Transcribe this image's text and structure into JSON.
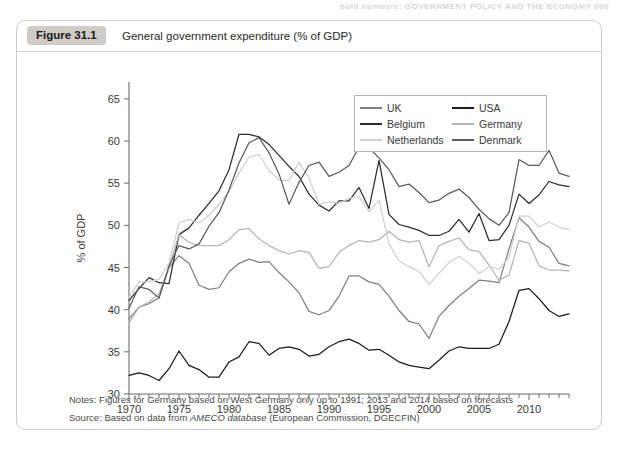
{
  "page": {
    "header_bleed": "bold numbers: GOVERNMENT POLICY AND THE ECONOMY  000"
  },
  "figure": {
    "badge": "Figure 31.1",
    "title": "General government expenditure (% of GDP)",
    "notes_label": "Notes:",
    "notes": "Notes: Figures for Germany based on West Germany only up to 1991; 2013 and 2014 based on forecasts",
    "source_prefix": "Source: Based on data from ",
    "source_em": "AMECO database",
    "source_suffix": " (European Commission, DGECFIN)",
    "source": "Source: Based on data from AMECO database (European Commission, DGECFIN)"
  },
  "legend": {
    "position": "inside-top-right",
    "entries": [
      {
        "label": "UK",
        "color": "#808080"
      },
      {
        "label": "USA",
        "color": "#1c1c1c"
      },
      {
        "label": "Belgium",
        "color": "#2e2e2e"
      },
      {
        "label": "Germany",
        "color": "#b5b5b5"
      },
      {
        "label": "Netherlands",
        "color": "#d0d0d0"
      },
      {
        "label": "Denmark",
        "color": "#5c5c5c"
      }
    ]
  },
  "chart_data": {
    "type": "line",
    "title": "General government expenditure (% of GDP)",
    "xlabel": "",
    "ylabel": "% of GDP",
    "xlim": [
      1970,
      2014
    ],
    "ylim": [
      30,
      67
    ],
    "ytick_values": [
      30,
      35,
      40,
      45,
      50,
      55,
      60,
      65
    ],
    "ytick_labels": [
      "30",
      "35",
      "40",
      "45",
      "50",
      "55",
      "60",
      "65"
    ],
    "xtick_values": [
      1970,
      1975,
      1980,
      1985,
      1990,
      1995,
      2000,
      2005,
      2010
    ],
    "xtick_labels": [
      "1970",
      "1975",
      "1980",
      "1985",
      "1990",
      "1995",
      "2000",
      "2005",
      "2010"
    ],
    "x_minor_tick_step": 1,
    "grid": false,
    "x": [
      1970,
      1971,
      1972,
      1973,
      1974,
      1975,
      1976,
      1977,
      1978,
      1979,
      1980,
      1981,
      1982,
      1983,
      1984,
      1985,
      1986,
      1987,
      1988,
      1989,
      1990,
      1991,
      1992,
      1993,
      1994,
      1995,
      1996,
      1997,
      1998,
      1999,
      2000,
      2001,
      2002,
      2003,
      2004,
      2005,
      2006,
      2007,
      2008,
      2009,
      2010,
      2011,
      2012,
      2013,
      2014
    ],
    "series": [
      {
        "name": "UK",
        "color": "#808080",
        "values": [
          38.9,
          40.3,
          40.7,
          41.4,
          45.0,
          46.4,
          45.5,
          42.9,
          42.4,
          42.6,
          44.5,
          45.5,
          46.0,
          45.6,
          45.7,
          44.4,
          43.3,
          42.0,
          39.8,
          39.4,
          39.9,
          41.6,
          44.0,
          44.0,
          43.3,
          43.0,
          41.6,
          39.9,
          38.6,
          38.3,
          36.6,
          39.2,
          40.5,
          41.6,
          42.5,
          43.5,
          43.4,
          43.2,
          47.2,
          50.9,
          49.8,
          48.1,
          47.4,
          45.5,
          45.2
        ]
      },
      {
        "name": "USA",
        "color": "#1c1c1c",
        "values": [
          32.2,
          32.5,
          32.2,
          31.6,
          33.0,
          35.1,
          33.4,
          32.9,
          32.0,
          32.0,
          33.8,
          34.4,
          36.2,
          36.0,
          34.6,
          35.4,
          35.6,
          35.3,
          34.5,
          34.7,
          35.6,
          36.2,
          36.5,
          36.0,
          35.2,
          35.3,
          34.6,
          33.8,
          33.4,
          33.2,
          33.0,
          34.0,
          35.1,
          35.6,
          35.4,
          35.4,
          35.4,
          35.9,
          38.6,
          42.3,
          42.5,
          41.3,
          39.9,
          39.2,
          39.5
        ]
      },
      {
        "name": "Belgium",
        "color": "#2e2e2e",
        "values": [
          41.1,
          42.5,
          43.8,
          43.2,
          43.1,
          48.9,
          49.7,
          51.2,
          52.6,
          54.1,
          56.6,
          60.8,
          60.8,
          60.5,
          59.6,
          58.3,
          57.0,
          55.8,
          53.7,
          52.4,
          51.7,
          52.9,
          52.9,
          54.5,
          52.0,
          57.7,
          51.3,
          50.1,
          49.8,
          49.4,
          48.8,
          48.8,
          49.3,
          50.7,
          49.2,
          51.4,
          48.2,
          48.3,
          50.0,
          53.7,
          52.6,
          53.6,
          55.2,
          54.8,
          54.6
        ]
      },
      {
        "name": "Germany",
        "color": "#b5b5b5",
        "values": [
          38.4,
          40.3,
          40.9,
          41.9,
          45.0,
          48.9,
          48.0,
          47.6,
          47.6,
          47.6,
          48.3,
          49.5,
          49.6,
          48.4,
          47.6,
          47.0,
          46.6,
          47.0,
          46.8,
          44.9,
          45.1,
          46.8,
          47.6,
          48.2,
          48.0,
          48.3,
          49.3,
          48.3,
          48.0,
          48.2,
          45.1,
          47.6,
          48.1,
          48.5,
          47.1,
          46.9,
          45.3,
          43.5,
          44.1,
          48.2,
          47.9,
          45.2,
          44.7,
          44.7,
          44.6
        ]
      },
      {
        "name": "Netherlands",
        "color": "#d0d0d0",
        "values": [
          41.4,
          43.3,
          43.3,
          43.6,
          45.5,
          50.3,
          50.7,
          50.3,
          51.2,
          52.5,
          54.0,
          56.2,
          58.1,
          58.4,
          56.5,
          55.4,
          55.3,
          57.5,
          55.6,
          52.5,
          52.8,
          52.6,
          53.2,
          53.4,
          51.6,
          53.0,
          47.8,
          45.8,
          45.1,
          44.5,
          43.0,
          44.3,
          45.6,
          46.3,
          45.5,
          44.3,
          45.1,
          44.8,
          46.2,
          51.1,
          51.1,
          49.8,
          50.4,
          49.8,
          49.5
        ]
      },
      {
        "name": "Denmark",
        "color": "#5c5c5c",
        "values": [
          40.2,
          42.7,
          42.4,
          41.4,
          45.2,
          47.6,
          47.2,
          47.8,
          49.9,
          51.5,
          54.2,
          57.4,
          59.8,
          60.4,
          58.6,
          56.1,
          52.5,
          55.1,
          57.1,
          57.5,
          55.8,
          56.3,
          57.1,
          59.3,
          59.2,
          58.0,
          56.6,
          54.6,
          54.9,
          53.9,
          52.7,
          53.0,
          53.8,
          54.3,
          53.3,
          51.9,
          50.8,
          50.0,
          51.5,
          57.8,
          57.1,
          57.1,
          58.9,
          56.2,
          55.8
        ]
      }
    ]
  }
}
